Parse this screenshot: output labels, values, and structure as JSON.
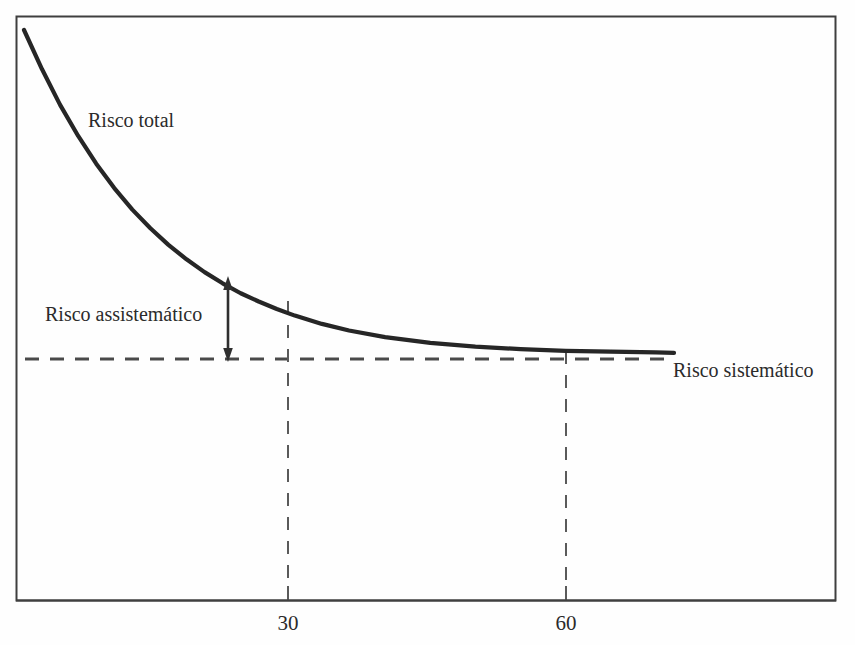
{
  "figure": {
    "background_color": "#fefefe",
    "frame_color": "#3a3a3a",
    "ink_color": "#2b2b2b"
  },
  "labels": {
    "risco_total": "Risco total",
    "risco_assistematico": "Risco assistemático",
    "risco_sistematico": "Risco sistemático"
  },
  "axis": {
    "tick_labels": [
      "30",
      "60"
    ],
    "tick_values": [
      30,
      60
    ]
  },
  "chart_data": {
    "type": "line",
    "title": "",
    "xlabel": "",
    "ylabel": "",
    "grid": false,
    "legend": "inline-annotations",
    "xlim": [
      0,
      72
    ],
    "ylim": [
      0,
      100
    ],
    "axis_ticks_x": [
      30,
      60
    ],
    "series": [
      {
        "name": "Risco total",
        "style": "solid",
        "color": "#2b2b2b",
        "description": "Total risk decays exponentially toward the systematic risk floor as the number of assets increases.",
        "x": [
          0,
          2,
          4,
          6,
          8,
          10,
          12,
          14,
          16,
          18,
          20,
          22,
          24,
          26,
          28,
          30,
          33,
          36,
          40,
          45,
          50,
          55,
          60,
          65,
          70,
          72
        ],
        "y": [
          100,
          90.5,
          81.9,
          74.4,
          67.7,
          61.8,
          56.6,
          52.1,
          48.1,
          44.6,
          41.5,
          38.8,
          36.4,
          34.4,
          32.6,
          31.0,
          29.0,
          27.4,
          25.8,
          24.4,
          23.5,
          22.9,
          22.5,
          22.3,
          22.1,
          22.0
        ]
      },
      {
        "name": "Risco sistemático",
        "style": "dashed",
        "color": "#4a4a4a",
        "description": "Horizontal asymptote representing non-diversifiable (systematic) risk.",
        "x": [
          0,
          72
        ],
        "y": [
          21.0,
          21.0
        ]
      }
    ],
    "annotations": [
      {
        "name": "risco-assistematico-arrow",
        "type": "double-arrow",
        "x": 21.5,
        "y_from": 21.0,
        "y_to": 41.0,
        "label": "Risco assistemático",
        "description": "Vertical double-headed arrow measuring the gap between total risk and systematic risk (the diversifiable part)."
      },
      {
        "name": "guide-line-30",
        "type": "vertical-dashed",
        "x": 30,
        "description": "Dashed guide dropping from the total-risk curve at 30 assets to the x-axis."
      },
      {
        "name": "guide-line-60",
        "type": "vertical-dashed",
        "x": 60,
        "description": "Dashed guide dropping from the total-risk curve at 60 assets to the x-axis."
      },
      {
        "name": "risco-total-label",
        "type": "text",
        "x": 8,
        "y": 72,
        "label": "Risco total"
      },
      {
        "name": "risco-sistematico-label",
        "type": "text",
        "x": 73,
        "y": 21,
        "label": "Risco sistemático"
      }
    ]
  }
}
